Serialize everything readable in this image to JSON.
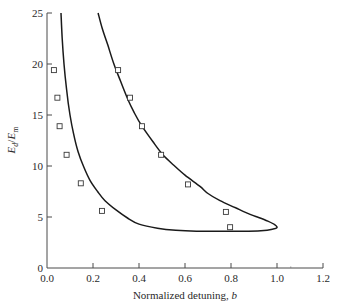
{
  "chart_data": {
    "type": "scatter",
    "title": "",
    "xlabel": "Normalized detuning, b",
    "xlabel_main": "Normalized detuning, ",
    "xlabel_var": "b",
    "ylabel": "E_d/E_m",
    "ylabel_parts": {
      "main": "E",
      "sub1": "d",
      "slash": "/",
      "main2": "E",
      "sub2": "m"
    },
    "xlim": [
      0.0,
      1.2
    ],
    "ylim": [
      0,
      25
    ],
    "xticks": [
      0.0,
      0.2,
      0.4,
      0.6,
      0.8,
      1.0,
      1.2
    ],
    "xtick_labels": [
      "0.0",
      "0.2",
      "0.4",
      "0.6",
      "0.8",
      "1.0",
      "1.2"
    ],
    "yticks": [
      0,
      5,
      10,
      15,
      20,
      25
    ],
    "ytick_labels": [
      "0",
      "5",
      "10",
      "15",
      "20",
      "25"
    ],
    "grid": false,
    "legend": null,
    "series": [
      {
        "name": "Boundary curve (closed loop)",
        "kind": "line",
        "color": "#1a1a1a",
        "inner_branch": [
          [
            0.061,
            25.0
          ],
          [
            0.066,
            22.5
          ],
          [
            0.074,
            20.0
          ],
          [
            0.085,
            17.5
          ],
          [
            0.1,
            15.0
          ],
          [
            0.115,
            13.2
          ],
          [
            0.135,
            11.4
          ],
          [
            0.16,
            9.9
          ],
          [
            0.187,
            8.6
          ],
          [
            0.22,
            7.5
          ],
          [
            0.252,
            6.6
          ],
          [
            0.3,
            5.7
          ],
          [
            0.35,
            4.9
          ],
          [
            0.4,
            4.3
          ],
          [
            0.48,
            3.9
          ],
          [
            0.56,
            3.7
          ],
          [
            0.65,
            3.6
          ],
          [
            0.75,
            3.6
          ],
          [
            0.85,
            3.6
          ],
          [
            0.93,
            3.65
          ],
          [
            0.98,
            3.8
          ],
          [
            1.0,
            3.95
          ]
        ],
        "outer_branch": [
          [
            1.0,
            3.95
          ],
          [
            0.99,
            4.25
          ],
          [
            0.96,
            4.6
          ],
          [
            0.92,
            4.95
          ],
          [
            0.883,
            5.25
          ],
          [
            0.82,
            5.9
          ],
          [
            0.752,
            6.6
          ],
          [
            0.7,
            7.3
          ],
          [
            0.665,
            8.0
          ],
          [
            0.6,
            9.1
          ],
          [
            0.55,
            10.1
          ],
          [
            0.504,
            11.1
          ],
          [
            0.46,
            12.4
          ],
          [
            0.413,
            13.9
          ],
          [
            0.38,
            15.2
          ],
          [
            0.352,
            16.5
          ],
          [
            0.32,
            18.3
          ],
          [
            0.291,
            20.0
          ],
          [
            0.265,
            21.8
          ],
          [
            0.24,
            23.5
          ],
          [
            0.222,
            25.0
          ]
        ]
      },
      {
        "name": "Measured points (left)",
        "kind": "scatter",
        "marker": "open-square",
        "points": [
          [
            0.03,
            19.4
          ],
          [
            0.045,
            16.7
          ],
          [
            0.055,
            13.9
          ],
          [
            0.085,
            11.1
          ],
          [
            0.147,
            8.3
          ],
          [
            0.239,
            5.6
          ]
        ]
      },
      {
        "name": "Measured points (right)",
        "kind": "scatter",
        "marker": "open-square",
        "points": [
          [
            0.309,
            19.4
          ],
          [
            0.361,
            16.7
          ],
          [
            0.413,
            13.9
          ],
          [
            0.496,
            11.1
          ],
          [
            0.613,
            8.2
          ],
          [
            0.778,
            5.5
          ],
          [
            0.796,
            4.0
          ]
        ]
      }
    ]
  },
  "layout": {
    "plot_left_px": 47,
    "plot_right_px": 323,
    "plot_top_px": 13,
    "plot_bottom_px": 268
  }
}
